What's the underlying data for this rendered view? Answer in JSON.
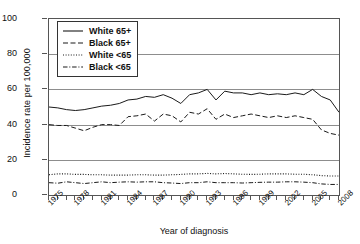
{
  "chart_data": {
    "type": "line",
    "title": "",
    "xlabel": "Year of diagnosis",
    "ylabel": "Incidence rate per 100,000",
    "xlim": [
      1975,
      2008
    ],
    "ylim": [
      0,
      100
    ],
    "yticks": [
      0,
      20,
      40,
      60,
      80,
      100
    ],
    "grid": true,
    "legend_position": "top-left",
    "x": [
      1975,
      1976,
      1977,
      1978,
      1979,
      1980,
      1981,
      1982,
      1983,
      1984,
      1985,
      1986,
      1987,
      1988,
      1989,
      1990,
      1991,
      1992,
      1993,
      1994,
      1995,
      1996,
      1997,
      1998,
      1999,
      2000,
      2001,
      2002,
      2003,
      2004,
      2005,
      2006,
      2007,
      2008
    ],
    "xtick_labels": [
      "1975",
      "1978",
      "1981",
      "1984",
      "1987",
      "1990",
      "1993",
      "1996",
      "1999",
      "2002",
      "2005",
      "2008"
    ],
    "xtick_label_years": [
      1975,
      1978,
      1981,
      1984,
      1987,
      1990,
      1993,
      1996,
      1999,
      2002,
      2005,
      2008
    ],
    "series": [
      {
        "name": "White 65+",
        "style": "solid",
        "color": "#1a1a1a",
        "values": [
          50,
          49.5,
          48.5,
          48,
          48.5,
          49.5,
          50.5,
          51,
          52,
          54,
          54.5,
          56,
          55.5,
          57,
          55,
          52,
          57,
          58,
          60,
          54,
          59,
          58,
          58,
          57,
          58,
          57,
          57.5,
          57,
          58,
          57,
          60,
          56,
          54,
          47
        ]
      },
      {
        "name": "Black 65+",
        "style": "dashed",
        "color": "#1a1a1a",
        "values": [
          40,
          39.5,
          39.5,
          38,
          36.5,
          38.5,
          40,
          40,
          39.5,
          44.5,
          45,
          46,
          42,
          46,
          45,
          41.5,
          47,
          46,
          49,
          43,
          46,
          44,
          45,
          46,
          45,
          44,
          45,
          44,
          45,
          44,
          43,
          37,
          35,
          34
        ]
      },
      {
        "name": "White <65",
        "style": "dotted",
        "color": "#1a1a1a",
        "values": [
          11.5,
          12,
          12,
          11.7,
          11.7,
          11.5,
          11.5,
          11.3,
          11.3,
          11.3,
          11.5,
          11.5,
          11.3,
          11.3,
          11.5,
          11.7,
          12,
          12,
          12.3,
          12,
          12.2,
          12,
          11.8,
          11.7,
          11.8,
          12,
          12,
          12,
          11.8,
          11.8,
          11.5,
          11,
          10.8,
          10.8
        ]
      },
      {
        "name": "Black <65",
        "style": "dashdot",
        "color": "#1a1a1a",
        "values": [
          7,
          6.7,
          7.5,
          7,
          6.5,
          7,
          7.5,
          7,
          7.3,
          7.5,
          7.3,
          7.5,
          7.5,
          7,
          6.8,
          6.5,
          7,
          7,
          7.5,
          7,
          7,
          7,
          6.8,
          7,
          7.2,
          7.3,
          7.3,
          7.5,
          7.5,
          7.3,
          7,
          6.3,
          6,
          6
        ]
      }
    ],
    "legend": [
      {
        "label": "White 65+",
        "style": "solid"
      },
      {
        "label": "Black 65+",
        "style": "dashed"
      },
      {
        "label": "White <65",
        "style": "dotted"
      },
      {
        "label": "Black <65",
        "style": "dashdot"
      }
    ]
  }
}
